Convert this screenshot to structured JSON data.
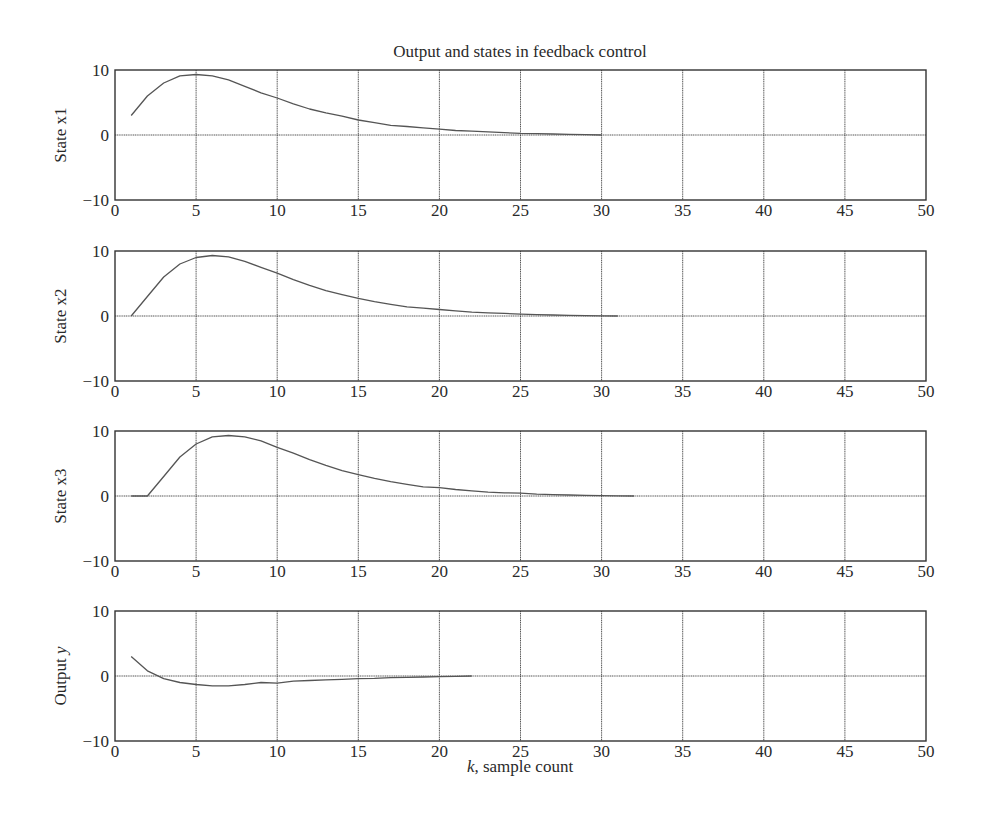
{
  "figure": {
    "title": "Output and states in feedback control",
    "xlabel_italic": "k",
    "xlabel_rest": ", sample count"
  },
  "chart_data": {
    "type": "line",
    "title": "Output and states in feedback control",
    "xlabel": "k, sample count",
    "xlim": [
      0,
      50
    ],
    "xticks": [
      0,
      5,
      10,
      15,
      20,
      25,
      30,
      35,
      40,
      45,
      50
    ],
    "grid": true,
    "layout": "4 stacked subplots sharing x-axis",
    "subplots": [
      {
        "ylabel": "State x1",
        "ylim": [
          -10,
          10
        ],
        "yticks": [
          -10,
          0,
          10
        ],
        "series": [
          {
            "name": "x1",
            "x": [
              1,
              2,
              3,
              4,
              5,
              6,
              7,
              8,
              9,
              10,
              11,
              12,
              13,
              14,
              15,
              16,
              17,
              18,
              19,
              20,
              21,
              22,
              23,
              24,
              25,
              26,
              27,
              28,
              29,
              30
            ],
            "values": [
              3.0,
              6.0,
              8.0,
              9.1,
              9.3,
              9.1,
              8.5,
              7.5,
              6.5,
              5.7,
              4.8,
              4.0,
              3.4,
              2.9,
              2.3,
              1.9,
              1.5,
              1.3,
              1.1,
              0.9,
              0.7,
              0.6,
              0.5,
              0.35,
              0.25,
              0.2,
              0.15,
              0.1,
              0.05,
              0.0
            ]
          }
        ]
      },
      {
        "ylabel": "State x2",
        "ylim": [
          -10,
          10
        ],
        "yticks": [
          -10,
          0,
          10
        ],
        "series": [
          {
            "name": "x2",
            "x": [
              1,
              2,
              3,
              4,
              5,
              6,
              7,
              8,
              9,
              10,
              11,
              12,
              13,
              14,
              15,
              16,
              17,
              18,
              19,
              20,
              21,
              22,
              23,
              24,
              25,
              26,
              27,
              28,
              29,
              30,
              31
            ],
            "values": [
              0.0,
              3.0,
              6.0,
              8.0,
              9.0,
              9.3,
              9.1,
              8.4,
              7.5,
              6.6,
              5.6,
              4.7,
              3.9,
              3.3,
              2.7,
              2.2,
              1.8,
              1.4,
              1.2,
              1.0,
              0.8,
              0.6,
              0.5,
              0.4,
              0.3,
              0.2,
              0.15,
              0.1,
              0.05,
              0.02,
              0.0
            ]
          }
        ]
      },
      {
        "ylabel": "State x3",
        "ylim": [
          -10,
          10
        ],
        "yticks": [
          -10,
          0,
          10
        ],
        "series": [
          {
            "name": "x3",
            "x": [
              1,
              2,
              3,
              4,
              5,
              6,
              7,
              8,
              9,
              10,
              11,
              12,
              13,
              14,
              15,
              16,
              17,
              18,
              19,
              20,
              21,
              22,
              23,
              24,
              25,
              26,
              27,
              28,
              29,
              30,
              31,
              32
            ],
            "values": [
              0.0,
              0.0,
              3.0,
              6.0,
              8.0,
              9.1,
              9.3,
              9.1,
              8.5,
              7.5,
              6.6,
              5.6,
              4.7,
              3.9,
              3.3,
              2.7,
              2.2,
              1.8,
              1.4,
              1.3,
              1.0,
              0.8,
              0.6,
              0.5,
              0.45,
              0.3,
              0.2,
              0.15,
              0.1,
              0.05,
              0.02,
              0.0
            ]
          }
        ]
      },
      {
        "ylabel": "Output y",
        "ylim": [
          -10,
          10
        ],
        "yticks": [
          -10,
          0,
          10
        ],
        "series": [
          {
            "name": "y",
            "x": [
              1,
              2,
              3,
              4,
              5,
              6,
              7,
              8,
              9,
              10,
              11,
              12,
              13,
              14,
              15,
              16,
              17,
              18,
              19,
              20,
              21,
              22
            ],
            "values": [
              3.0,
              0.8,
              -0.4,
              -1.0,
              -1.3,
              -1.5,
              -1.5,
              -1.3,
              -1.0,
              -1.1,
              -0.8,
              -0.7,
              -0.6,
              -0.5,
              -0.4,
              -0.35,
              -0.25,
              -0.2,
              -0.15,
              -0.1,
              -0.05,
              0.0
            ]
          }
        ]
      }
    ]
  }
}
